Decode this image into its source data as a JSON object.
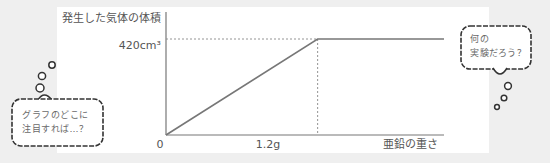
{
  "chart_data": {
    "type": "line",
    "ylabel": "発生した気体の体積",
    "xlabel": "亜鉛の重さ",
    "origin_label": "0",
    "x_tick_labels": [
      "1.2g"
    ],
    "y_tick_labels": [
      "420cm³"
    ],
    "series": [
      {
        "name": "gas volume",
        "x": [
          0,
          1.2,
          2.2
        ],
        "y": [
          0,
          420,
          420
        ]
      }
    ],
    "reference_lines": [
      {
        "type": "vertical",
        "x": 1.2,
        "style": "dotted"
      },
      {
        "type": "horizontal",
        "y": 420,
        "style": "dotted"
      }
    ],
    "xlim": [
      0,
      2.2
    ],
    "ylim": [
      0,
      560
    ],
    "grid": false
  },
  "bubbles": {
    "left": {
      "lines": [
        "グラフのどこに",
        "注目すれば…？"
      ]
    },
    "right": {
      "lines": [
        "何の",
        "実験だろう？"
      ]
    }
  }
}
